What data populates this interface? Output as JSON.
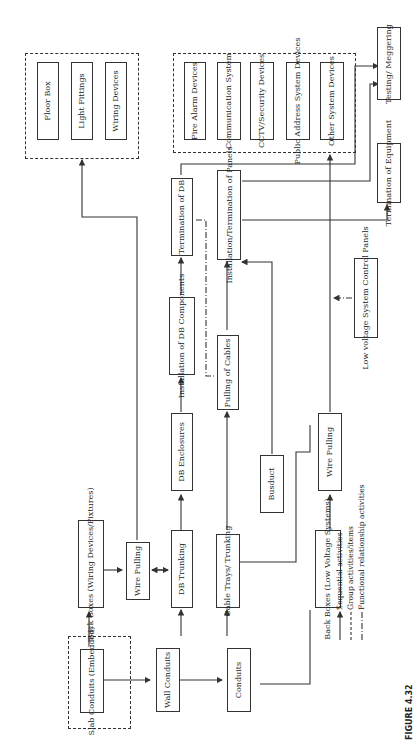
{
  "diagram": {
    "nodes": {
      "slab_conduits": "Slab Conduits (Embedded)",
      "wall_conduits": "Wall Conduits",
      "conduits": "Conduits",
      "back_boxes_wiring": "Back Boxes (Wiring Devices/Fixtures)",
      "wire_pulling_1": "Wire Pulling",
      "db_trunking": "DB Trunking",
      "cable_trays": "Cable Trays/ Trunking",
      "back_boxes_lv": "Back Boxes (Low Voltage Systems)",
      "db_enclosures": "DB Enclosures",
      "busduct": "Busduct",
      "wire_pulling_2": "Wire Pulling",
      "installation_db_components": "Installation of DB Components",
      "pulling_of_cables": "Pulling of Cables",
      "termination_db": "Termination of DB",
      "installation_panels": "Installation/Termination of Panels",
      "lv_control_panels": "Low voltage System Control Panels",
      "termination_equipment": "Termination of Equipment",
      "testing": "Testing/ Meggering",
      "floor_box": "Floor Box",
      "light_fittings": "Light Fittings",
      "wiring_devices": "Wiring Devices",
      "fire_alarm": "Fire Alarm Devices",
      "communication": "Communication System",
      "cctv": "CCTV/Security Devices",
      "public_address": "Public Address System Devices",
      "other_system": "Other System Devices"
    },
    "legend": {
      "sequential": "Sequential activities",
      "group": "Group activities/items",
      "functional": "Functional relationship activities"
    },
    "caption": "FIGURE 4.32"
  }
}
